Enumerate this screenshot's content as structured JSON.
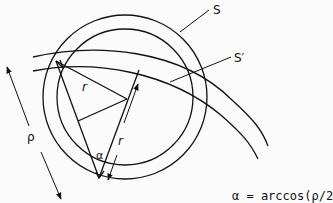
{
  "diagram": {
    "labels": {
      "outer_circle": "S",
      "inner_circle": "S′",
      "radius_top": "r",
      "radius_side": "r",
      "distance": "ρ",
      "angle": "α"
    },
    "formula": "α = arccos(ρ/2",
    "colors": {
      "line": "#111111",
      "background": "#fbfbfb"
    }
  }
}
